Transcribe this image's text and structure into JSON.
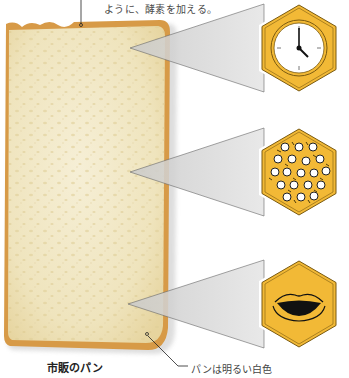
{
  "captions": {
    "top": "ように、酵素を加える。",
    "bread_label": "市販のパン",
    "bread_note": "パンは明るい白色"
  },
  "callouts": [
    {
      "id": "freshness-time",
      "icon": "clock-icon",
      "apex": [
        130,
        48
      ],
      "center": [
        299,
        48
      ]
    },
    {
      "id": "texture-bubbles",
      "icon": "air-bubbles-icon",
      "apex": [
        130,
        172
      ],
      "center": [
        299,
        172
      ]
    },
    {
      "id": "taste-mouth",
      "icon": "lips-icon",
      "apex": [
        128,
        304
      ],
      "center": [
        299,
        304
      ]
    }
  ],
  "colors": {
    "hex_fill": "#f2b936",
    "hex_border": "#7a5a10",
    "bread_crumb": "#f1e8c6",
    "bread_crust": "#d99a44",
    "callout_gray": "#d9d9d9"
  }
}
